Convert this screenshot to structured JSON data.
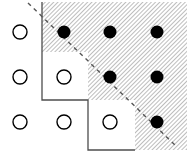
{
  "figure": {
    "title": "",
    "width": 187,
    "height": 152,
    "background_color": "#ffffff"
  },
  "chart_data": {
    "type": "scatter",
    "title": "",
    "subtitle": "",
    "xlabel": "",
    "ylabel": "",
    "grid": false,
    "legend_position": "none",
    "xlim": [
      0,
      187
    ],
    "ylim": [
      0,
      152
    ],
    "marker_styles": [
      {
        "name": "open-circle",
        "fill": "#ffffff",
        "stroke": "#000000",
        "meaning": "point outside hatched region"
      },
      {
        "name": "filled-dot",
        "fill": "#000000",
        "stroke": "#000000",
        "meaning": "point inside hatched region"
      }
    ],
    "columns_x": [
      20,
      64,
      110,
      157
    ],
    "rows_y": [
      32,
      77,
      122
    ],
    "series": [
      {
        "name": "open-circle",
        "marker": "open-circle",
        "radius": 7,
        "points": [
          {
            "x": 20,
            "y": 32
          },
          {
            "x": 20,
            "y": 77
          },
          {
            "x": 64,
            "y": 77
          },
          {
            "x": 20,
            "y": 122
          },
          {
            "x": 64,
            "y": 122
          },
          {
            "x": 110,
            "y": 122
          }
        ]
      },
      {
        "name": "filled-dot",
        "marker": "filled-dot",
        "radius": 6.5,
        "points": [
          {
            "x": 64,
            "y": 32
          },
          {
            "x": 110,
            "y": 32
          },
          {
            "x": 157,
            "y": 32
          },
          {
            "x": 110,
            "y": 77
          },
          {
            "x": 157,
            "y": 77
          },
          {
            "x": 157,
            "y": 122
          }
        ]
      }
    ],
    "hatched_region": {
      "name": "staircase-region",
      "fill_pattern": "diagonal-hatch",
      "hatch_angle_deg": 45,
      "hatch_color": "#8c8c8c",
      "hatch_spacing": 3,
      "border_color": "#4d4d4d",
      "border_width": 1.3,
      "polygon_points": "42,2 187,2 187,150 135,150 135,100 88,100 88,52 42,52 42,2",
      "staircase_steps": [
        {
          "corner_x": 42,
          "corner_y": 52
        },
        {
          "corner_x": 88,
          "corner_y": 100
        },
        {
          "corner_x": 135,
          "corner_y": 150
        }
      ]
    },
    "dashed_line": {
      "name": "diagonal-cut-line",
      "x1": 28,
      "y1": 3,
      "x2": 176,
      "y2": 146,
      "color": "#555555",
      "width": 1.4,
      "dash_pattern": "4,4",
      "slope": 0.966
    }
  }
}
